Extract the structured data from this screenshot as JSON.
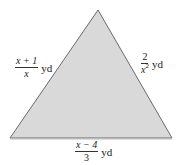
{
  "diagram": {
    "shape": "triangle",
    "fill_color": "#d9d9d9",
    "stroke_color": "#6b6b6b",
    "vertices": [
      [
        98,
        10
      ],
      [
        10,
        138
      ],
      [
        172,
        138
      ]
    ],
    "sides": {
      "left": {
        "numerator": "x + 1",
        "denominator": "x",
        "unit": "yd"
      },
      "right": {
        "numerator": "2",
        "denominator": "x",
        "denominator_exponent": "2",
        "unit": "yd"
      },
      "bottom": {
        "numerator": "x − 4",
        "denominator": "3",
        "unit": "yd"
      }
    }
  }
}
